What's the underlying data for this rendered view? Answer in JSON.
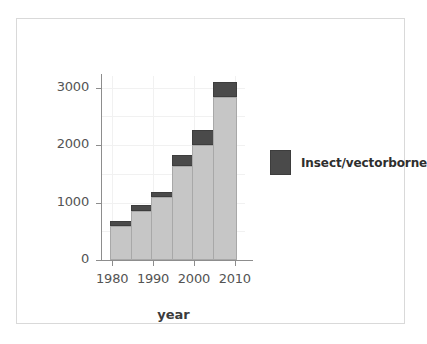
{
  "chart_data": {
    "type": "bar",
    "stacked": true,
    "title": "",
    "xlabel": "year",
    "ylabel": "",
    "categories": [
      "1980",
      "1985",
      "1990",
      "1995",
      "2000",
      "2005"
    ],
    "x": [
      1980,
      1985,
      1990,
      1995,
      2000,
      2005
    ],
    "series": [
      {
        "name": "Other",
        "color": "#c6c6c6",
        "values": [
          600,
          850,
          1100,
          1630,
          2000,
          2830
        ]
      },
      {
        "name": "Insect/vectorborne",
        "color": "#4a4a4a",
        "values": [
          80,
          100,
          80,
          190,
          260,
          270
        ]
      }
    ],
    "totals": [
      680,
      950,
      1180,
      1820,
      2260,
      3100
    ],
    "ylim": [
      0,
      3200
    ],
    "yticks": [
      "0",
      "1000",
      "2000",
      "3000"
    ],
    "ytick_values": [
      0,
      1000,
      2000,
      3000
    ],
    "xticks": [
      "1980",
      "1990",
      "2000",
      "2010"
    ],
    "xtick_values": [
      1980,
      1990,
      2000,
      2010
    ],
    "grid": true,
    "legend_position": "right"
  },
  "legend": {
    "entries": [
      {
        "label": "Insect/vectorborne",
        "color": "#4a4a4a"
      }
    ]
  },
  "axis": {
    "x_title": "year"
  },
  "colors": {
    "bar_main": "#c6c6c6",
    "bar_top": "#4a4a4a",
    "axis": "#8d8d8d",
    "grid": "#f1f1f1",
    "frame": "#d9d9d9",
    "text": "#545454"
  }
}
